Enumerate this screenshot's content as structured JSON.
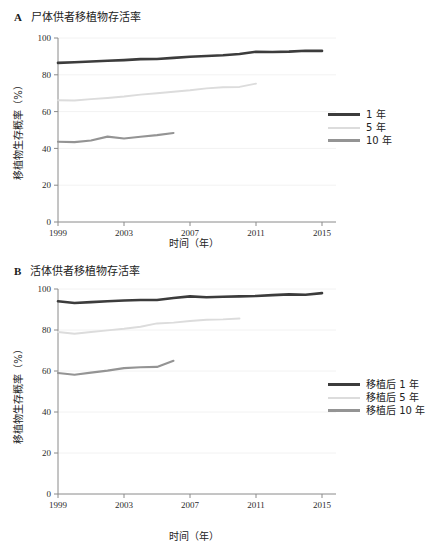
{
  "figure": {
    "background": "#ffffff",
    "colors": {
      "series_1yr": "#3c3c3c",
      "series_5yr": "#dcdcdc",
      "series_10yr": "#949494",
      "axis": "#8a8a8a",
      "grid": "#f2f2f2",
      "text": "#222222"
    }
  },
  "panels": [
    {
      "letter": "A",
      "title": "尸体供者移植物存活率",
      "legend": [
        "1 年",
        "5 年",
        "10 年"
      ]
    },
    {
      "letter": "B",
      "title": "活体供者移植物存活率",
      "legend": [
        "移植后 1 年",
        "移植后 5 年",
        "移植后 10 年"
      ]
    }
  ],
  "chart_data": [
    {
      "type": "line",
      "panel": "A",
      "title": "尸体供者移植物存活率",
      "xlabel": "时间（年）",
      "ylabel": "移植物生存概率（%）",
      "xlim": [
        1999,
        2015
      ],
      "ylim": [
        0,
        100
      ],
      "xticks": [
        1999,
        2003,
        2007,
        2011,
        2015
      ],
      "yticks": [
        0,
        20,
        40,
        60,
        80,
        100
      ],
      "grid": true,
      "legend_position": "right",
      "series": [
        {
          "name": "1 年",
          "color": "#3c3c3c",
          "style": "solid",
          "x": [
            1999,
            2000,
            2001,
            2002,
            2003,
            2004,
            2005,
            2006,
            2007,
            2008,
            2009,
            2010,
            2011,
            2012,
            2013,
            2014,
            2015
          ],
          "values": [
            86.5,
            86.8,
            87.2,
            87.6,
            88.0,
            88.5,
            88.6,
            89.2,
            89.8,
            90.2,
            90.6,
            91.3,
            92.5,
            92.4,
            92.6,
            93.1,
            93.0
          ]
        },
        {
          "name": "5 年",
          "color": "#dcdcdc",
          "style": "solid",
          "x": [
            1999,
            2000,
            2001,
            2002,
            2003,
            2004,
            2005,
            2006,
            2007,
            2008,
            2009,
            2010,
            2011
          ],
          "values": [
            66.2,
            66.0,
            66.8,
            67.4,
            68.2,
            69.2,
            70.0,
            70.8,
            71.6,
            72.6,
            73.2,
            73.4,
            75.2
          ]
        },
        {
          "name": "10 年",
          "color": "#949494",
          "style": "solid",
          "x": [
            1999,
            2000,
            2001,
            2002,
            2003,
            2004,
            2005,
            2006
          ],
          "values": [
            43.6,
            43.4,
            44.3,
            46.4,
            45.4,
            46.3,
            47.2,
            48.4
          ]
        }
      ]
    },
    {
      "type": "line",
      "panel": "B",
      "title": "活体供者移植物存活率",
      "xlabel": "时间（年）",
      "ylabel": "移植物生存概率（%）",
      "xlim": [
        1999,
        2015
      ],
      "ylim": [
        0,
        100
      ],
      "xticks": [
        1999,
        2003,
        2007,
        2011,
        2015
      ],
      "yticks": [
        0,
        20,
        40,
        60,
        80,
        100
      ],
      "grid": true,
      "legend_position": "right",
      "series": [
        {
          "name": "移植后 1 年",
          "color": "#3c3c3c",
          "style": "solid",
          "x": [
            1999,
            2000,
            2001,
            2002,
            2003,
            2004,
            2005,
            2006,
            2007,
            2008,
            2009,
            2010,
            2011,
            2012,
            2013,
            2014,
            2015
          ],
          "values": [
            94.0,
            93.2,
            93.6,
            94.0,
            94.4,
            94.6,
            94.6,
            95.6,
            96.4,
            96.0,
            96.2,
            96.4,
            96.6,
            97.0,
            97.4,
            97.2,
            98.0
          ]
        },
        {
          "name": "移植后 5 年",
          "color": "#dcdcdc",
          "style": "solid",
          "x": [
            1999,
            2000,
            2001,
            2002,
            2003,
            2004,
            2005,
            2006,
            2007,
            2008,
            2009,
            2010
          ],
          "values": [
            79.0,
            78.2,
            79.0,
            79.8,
            80.6,
            81.6,
            83.2,
            83.6,
            84.4,
            85.0,
            85.2,
            85.6
          ]
        },
        {
          "name": "移植后 10 年",
          "color": "#949494",
          "style": "solid",
          "x": [
            1999,
            2000,
            2001,
            2002,
            2003,
            2004,
            2005,
            2006
          ],
          "values": [
            59.0,
            58.2,
            59.2,
            60.2,
            61.4,
            61.8,
            62.0,
            65.0
          ]
        }
      ]
    }
  ]
}
